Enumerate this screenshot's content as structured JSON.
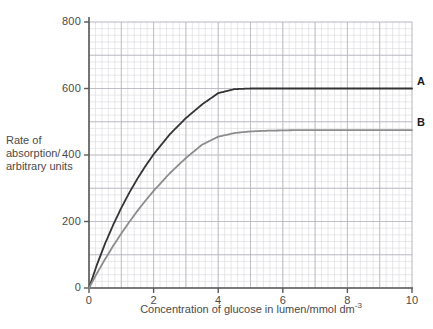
{
  "chart_data": {
    "type": "line",
    "title": "",
    "subtitle": "",
    "xlabel": "Concentration of glucose in lumen/mmol dm",
    "xlabel_sup": "-3",
    "ylabel_lines": [
      "Rate of",
      "absorption/",
      "arbitrary units"
    ],
    "ylabel": "Rate of absorption/ arbitrary units",
    "xlim": [
      0,
      10
    ],
    "ylim": [
      0,
      800
    ],
    "xticks": [
      0,
      2,
      4,
      6,
      8,
      10
    ],
    "xtick_labels": [
      "0",
      "2",
      "4",
      "6",
      "8",
      "10"
    ],
    "yticks": [
      0,
      200,
      400,
      600,
      800
    ],
    "ytick_labels": [
      "0",
      "200",
      "400",
      "600",
      "800"
    ],
    "grid": true,
    "grid_minor_step_x": 0.2,
    "grid_minor_step_y": 20,
    "grid_major_step_x": 1,
    "grid_major_step_y": 100,
    "legend_position": "right-inline",
    "series": [
      {
        "name": "A",
        "label": "A",
        "color": "#333333",
        "width": 1.8,
        "plateau": 600,
        "km": 1.85,
        "x": [
          0,
          0.25,
          0.5,
          0.75,
          1,
          1.25,
          1.5,
          1.75,
          2,
          2.5,
          3,
          3.5,
          4,
          4.5,
          5,
          5.5,
          6,
          6.5,
          7,
          7.5,
          8,
          8.5,
          9,
          9.5,
          10
        ],
        "values": [
          0,
          71,
          134,
          190,
          241,
          287,
          329,
          367,
          402,
          462,
          511,
          552,
          586,
          598,
          600,
          600,
          600,
          600,
          600,
          600,
          600,
          600,
          600,
          600,
          600
        ]
      },
      {
        "name": "B",
        "label": "B",
        "color": "#8c8c8c",
        "width": 1.8,
        "plateau": 475,
        "km": 2.6,
        "x": [
          0,
          0.25,
          0.5,
          0.75,
          1,
          1.25,
          1.5,
          1.75,
          2,
          2.5,
          3,
          3.5,
          4,
          4.5,
          5,
          5.5,
          6,
          6.5,
          7,
          7.5,
          8,
          8.5,
          9,
          9.5,
          10
        ],
        "values": [
          0,
          45,
          87,
          127,
          164,
          199,
          232,
          263,
          292,
          345,
          391,
          431,
          455,
          466,
          471,
          473,
          474,
          475,
          475,
          475,
          475,
          475,
          475,
          475,
          475
        ]
      }
    ]
  },
  "geometry": {
    "plot_left": 89,
    "plot_right": 412,
    "plot_top": 22,
    "plot_bottom": 288
  },
  "colors": {
    "grid_minor": "#d9d9dd",
    "grid_major": "#b4b4bc",
    "axis": "#5a5a5a",
    "text": "#4a4a4a",
    "series_a": "#333333",
    "series_b": "#8c8c8c"
  }
}
